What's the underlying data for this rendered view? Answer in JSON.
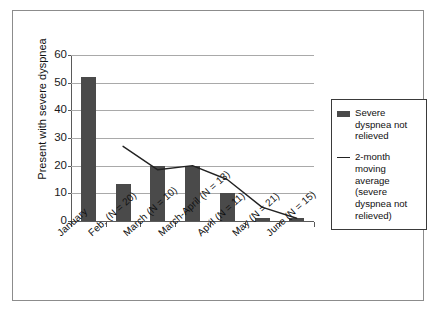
{
  "chart_data": {
    "type": "bar",
    "title": "",
    "subtitle": "",
    "xlabel": "",
    "ylabel": "Present with severe dyspnea",
    "ylim": [
      0,
      60
    ],
    "yticks": [
      0,
      10,
      20,
      30,
      40,
      50,
      60
    ],
    "grid": true,
    "legend_position": "right",
    "categories": [
      "January",
      "Feb. (N = 20)",
      "March (N = 10)",
      "March-April (N = 13)",
      "April (N = 11)",
      "May (N = 21)",
      "June (N = 15)"
    ],
    "series": [
      {
        "name": "Severe dyspnea not relieved",
        "type": "bar",
        "color": "#4a4a4a",
        "values": [
          52,
          13.5,
          20,
          20,
          10,
          1,
          1
        ]
      },
      {
        "name": "2-month moving average (severe dyspnea not relieved)",
        "type": "line",
        "color": "#222222",
        "values": [
          null,
          27,
          18.5,
          20,
          15,
          5,
          1
        ]
      }
    ]
  },
  "axis": {
    "y_title": "Present with severe dyspnea",
    "y_ticks": [
      "60",
      "50",
      "40",
      "30",
      "20",
      "10",
      "0"
    ],
    "x_labels": [
      "January",
      "Feb. (N = 20)",
      "March (N = 10)",
      "March-April (N = 13)",
      "April (N = 11)",
      "May (N = 21)",
      "June (N = 15)"
    ]
  },
  "legend": {
    "items": [
      {
        "label": "Severe dyspnea\nnot relieved",
        "marker": "bar-swatch",
        "color": "#4a4a4a"
      },
      {
        "label": "2-month\nmoving average\n(severe dyspnea\nnot relieved)",
        "marker": "line-swatch",
        "color": "#222222"
      }
    ]
  }
}
